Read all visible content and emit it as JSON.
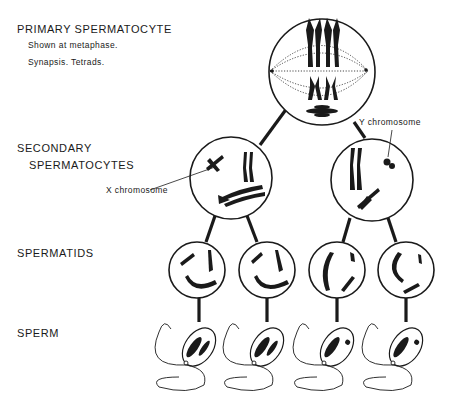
{
  "stages": [
    {
      "label": "PRIMARY SPERMATOCYTE",
      "notes": [
        "Shown at metaphase.",
        "Synapsis. Tetrads."
      ]
    },
    {
      "label_lines": [
        "SECONDARY",
        "SPERMATOCYTES"
      ]
    },
    {
      "label": "SPERMATIDS"
    },
    {
      "label": "SPERM"
    }
  ],
  "annotations": {
    "x_chromosome": "X  chromosome",
    "y_chromosome": "Y  chromosome"
  },
  "colors": {
    "ink": "#1a1a1a",
    "background": "#ffffff"
  }
}
